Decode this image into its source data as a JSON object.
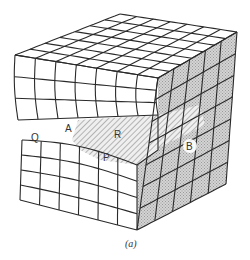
{
  "figure": {
    "caption": "(a)",
    "labels": {
      "Q": "Q",
      "A": "A",
      "R": "R",
      "P": "P",
      "B": "B"
    },
    "colors": {
      "line": "#2a2a2a",
      "background": "#ffffff",
      "right_face": "#c8c8c8",
      "hatch": "#8a8a8a"
    },
    "grid": {
      "top_divisions_x": 7,
      "top_divisions_y": 7,
      "front_columns": 7,
      "front_rows": 7,
      "right_columns": 5,
      "right_rows": 7
    }
  }
}
